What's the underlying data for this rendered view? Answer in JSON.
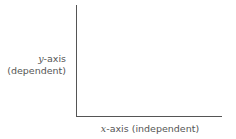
{
  "diagram": {
    "y_axis": {
      "variable": "y",
      "suffix": "-axis",
      "description": "(dependent)"
    },
    "x_axis": {
      "variable": "x",
      "suffix": "-axis (independent)"
    }
  }
}
